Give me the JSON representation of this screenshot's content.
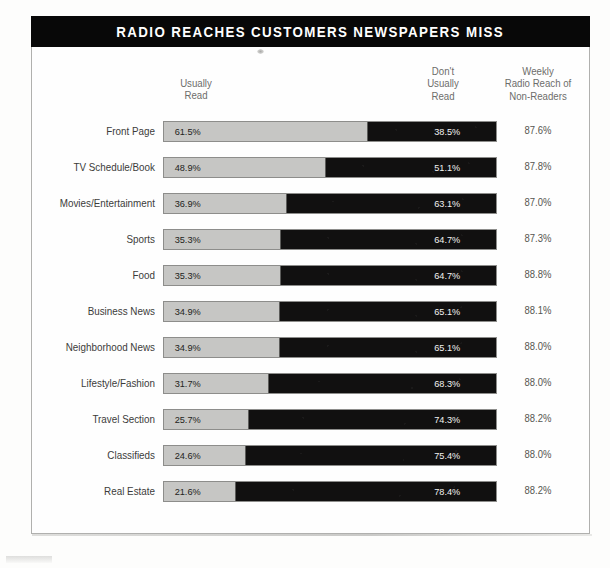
{
  "title": "RADIO REACHES CUSTOMERS NEWSPAPERS MISS",
  "headers": {
    "usually_read": "Usually\nRead",
    "dont_usually_read": "Don't\nUsually\nRead",
    "weekly_reach": "Weekly\nRadio Reach of\nNon-Readers"
  },
  "colors": {
    "title_band": "#080808",
    "usually_read_bar": "#c6c6c4",
    "dont_usually_read_bar": "#111010",
    "frame": "#b0b0ae",
    "label_text": "#3c3c3a"
  },
  "chart_data": {
    "type": "bar",
    "title": "RADIO REACHES CUSTOMERS NEWSPAPERS MISS",
    "xlabel": "",
    "ylabel": "",
    "stacked": true,
    "orientation": "horizontal",
    "xlim": [
      0,
      100
    ],
    "grid": false,
    "legend_position": "top",
    "categories": [
      "Front Page",
      "TV Schedule/Book",
      "Movies/Entertainment",
      "Sports",
      "Food",
      "Business News",
      "Neighborhood News",
      "Lifestyle/Fashion",
      "Travel Section",
      "Classifieds",
      "Real Estate"
    ],
    "series": [
      {
        "name": "Usually Read",
        "values": [
          61.5,
          48.9,
          36.9,
          35.3,
          35.3,
          34.9,
          34.9,
          31.7,
          25.7,
          24.6,
          21.6
        ]
      },
      {
        "name": "Don't Usually Read",
        "values": [
          38.5,
          51.1,
          63.1,
          64.7,
          64.7,
          65.1,
          65.1,
          68.3,
          74.3,
          75.4,
          78.4
        ]
      }
    ],
    "annotation_column": {
      "name": "Weekly Radio Reach of Non-Readers",
      "values": [
        87.6,
        87.8,
        87.0,
        87.3,
        88.8,
        88.1,
        88.0,
        88.0,
        88.2,
        88.0,
        88.2
      ]
    }
  },
  "rows": [
    {
      "label": "Front Page",
      "read": "61.5%",
      "not_read": "38.5%",
      "reach": "87.6%",
      "read_pct": 61.5
    },
    {
      "label": "TV Schedule/Book",
      "read": "48.9%",
      "not_read": "51.1%",
      "reach": "87.8%",
      "read_pct": 48.9
    },
    {
      "label": "Movies/Entertainment",
      "read": "36.9%",
      "not_read": "63.1%",
      "reach": "87.0%",
      "read_pct": 36.9
    },
    {
      "label": "Sports",
      "read": "35.3%",
      "not_read": "64.7%",
      "reach": "87.3%",
      "read_pct": 35.3
    },
    {
      "label": "Food",
      "read": "35.3%",
      "not_read": "64.7%",
      "reach": "88.8%",
      "read_pct": 35.3
    },
    {
      "label": "Business News",
      "read": "34.9%",
      "not_read": "65.1%",
      "reach": "88.1%",
      "read_pct": 34.9
    },
    {
      "label": "Neighborhood News",
      "read": "34.9%",
      "not_read": "65.1%",
      "reach": "88.0%",
      "read_pct": 34.9
    },
    {
      "label": "Lifestyle/Fashion",
      "read": "31.7%",
      "not_read": "68.3%",
      "reach": "88.0%",
      "read_pct": 31.7
    },
    {
      "label": "Travel Section",
      "read": "25.7%",
      "not_read": "74.3%",
      "reach": "88.2%",
      "read_pct": 25.7
    },
    {
      "label": "Classifieds",
      "read": "24.6%",
      "not_read": "75.4%",
      "reach": "88.0%",
      "read_pct": 24.6
    },
    {
      "label": "Real Estate",
      "read": "21.6%",
      "not_read": "78.4%",
      "reach": "88.2%",
      "read_pct": 21.6
    }
  ]
}
